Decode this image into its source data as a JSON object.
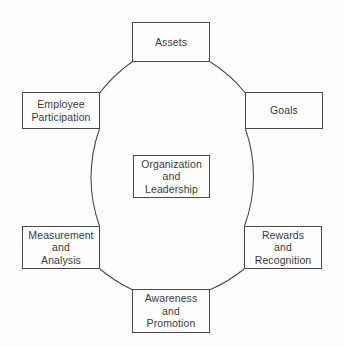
{
  "diagram": {
    "type": "cycle-diagram",
    "shape": "circle",
    "line_color": "#4a4a4a",
    "text_color": "#3a3a3a",
    "background_color": "#fefefe",
    "circle": {
      "center_x": 171,
      "center_y": 177,
      "radius": 143
    },
    "center_node": {
      "id": "organization-and-leadership",
      "label": "Organization\nand\nLeadership",
      "lines": [
        "Organization",
        "and",
        "Leadership"
      ]
    },
    "nodes": [
      {
        "id": "assets",
        "label": "Assets",
        "lines": [
          "Assets"
        ],
        "position": "top",
        "angle_deg": 90
      },
      {
        "id": "goals",
        "label": "Goals",
        "lines": [
          "Goals"
        ],
        "position": "upper-right",
        "angle_deg": 30
      },
      {
        "id": "rewards-and-recognition",
        "label": "Rewards\nand\nRecognition",
        "lines": [
          "Rewards",
          "and",
          "Recognition"
        ],
        "position": "lower-right",
        "angle_deg": -30
      },
      {
        "id": "awareness-and-promotion",
        "label": "Awareness\nand\nPromotion",
        "lines": [
          "Awareness",
          "and",
          "Promotion"
        ],
        "position": "bottom",
        "angle_deg": -90
      },
      {
        "id": "measurement-and-analysis",
        "label": "Measurement\nand\nAnalysis",
        "lines": [
          "Measurement",
          "and",
          "Analysis"
        ],
        "position": "lower-left",
        "angle_deg": -150
      },
      {
        "id": "employee-participation",
        "label": "Employee\nParticipation",
        "lines": [
          "Employee",
          "Participation"
        ],
        "position": "upper-left",
        "angle_deg": 150
      }
    ],
    "arcs": [
      {
        "id": "arc-assets-to-goals",
        "from": "assets",
        "to": "goals"
      },
      {
        "id": "arc-goals-to-rewards",
        "from": "goals",
        "to": "rewards-and-recognition"
      },
      {
        "id": "arc-rewards-to-awareness",
        "from": "rewards-and-recognition",
        "to": "awareness-and-promotion"
      },
      {
        "id": "arc-awareness-to-measurement",
        "from": "awareness-and-promotion",
        "to": "measurement-and-analysis"
      },
      {
        "id": "arc-measurement-to-employee",
        "from": "measurement-and-analysis",
        "to": "employee-participation"
      },
      {
        "id": "arc-employee-to-assets",
        "from": "employee-participation",
        "to": "assets"
      }
    ]
  }
}
